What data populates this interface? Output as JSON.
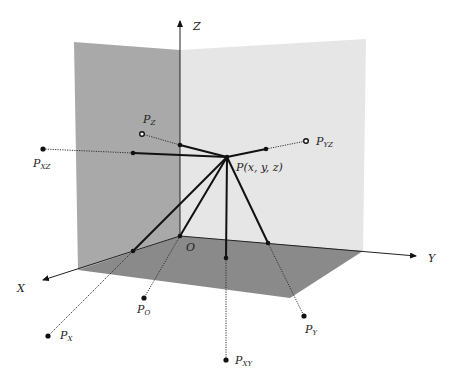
{
  "diagram": {
    "colors": {
      "xz_plane": "#a9a9a9",
      "yz_plane": "#e6e6e6",
      "xy_plane": "#8a8a8a",
      "lines": "#111111"
    },
    "axes": {
      "x": "X",
      "y": "Y",
      "z": "Z",
      "origin": "O"
    },
    "point": {
      "base": "P",
      "coords": "(x, y, z)"
    },
    "projections": [
      {
        "id": "pz",
        "base": "P",
        "sub": "Z",
        "marker": "ring"
      },
      {
        "id": "pxz",
        "base": "P",
        "sub": "XZ",
        "marker": "dot"
      },
      {
        "id": "pyz",
        "base": "P",
        "sub": "YZ",
        "marker": "ring"
      },
      {
        "id": "px",
        "base": "P",
        "sub": "X",
        "marker": "dot"
      },
      {
        "id": "po",
        "base": "P",
        "sub": "O",
        "marker": "dot"
      },
      {
        "id": "pxy",
        "base": "P",
        "sub": "XY",
        "marker": "dot"
      },
      {
        "id": "py",
        "base": "P",
        "sub": "Y",
        "marker": "dot"
      }
    ]
  }
}
